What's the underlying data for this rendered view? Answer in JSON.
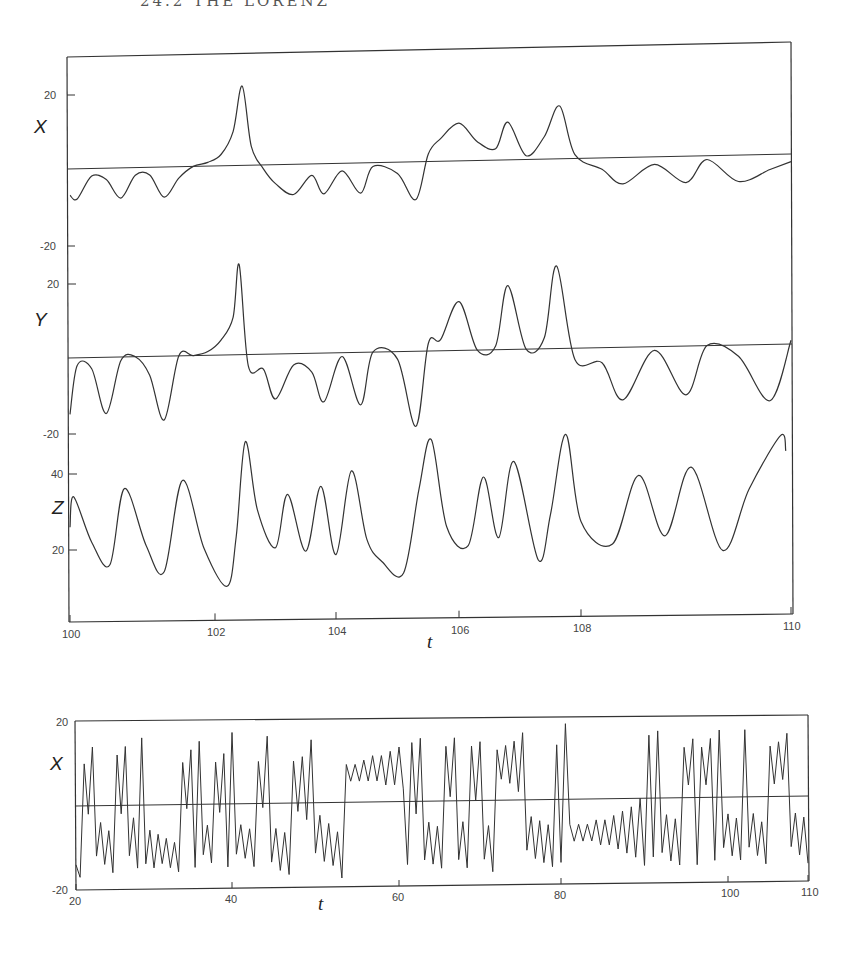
{
  "header": {
    "text": "24.2   THE LORENZ"
  },
  "chart_data": [
    {
      "type": "line",
      "title": "",
      "xlabel": "t",
      "x_ticks": [
        100,
        102,
        104,
        106,
        108,
        110
      ],
      "xlim": [
        100,
        110
      ],
      "panels": [
        {
          "ylabel": "X",
          "y_ticks": [
            20,
            -20
          ],
          "zero_line": true,
          "series": {
            "name": "X",
            "x": [
              100.0,
              100.1,
              100.3,
              100.5,
              100.7,
              100.9,
              101.1,
              101.3,
              101.5,
              101.7,
              101.9,
              102.1,
              102.3,
              102.45,
              102.6,
              102.8,
              103.0,
              103.3,
              103.6,
              103.8,
              104.1,
              104.4,
              104.6,
              105.0,
              105.3,
              105.5,
              105.7,
              106.0,
              106.3,
              106.6,
              106.8,
              107.1,
              107.4,
              107.65,
              107.9,
              108.2,
              108.4,
              108.7,
              109.0,
              109.2,
              109.5,
              109.8,
              110.0
            ],
            "y": [
              -7,
              -8,
              -2,
              -3,
              -8,
              -2,
              -2,
              -8,
              -3,
              0,
              1,
              3,
              9,
              21,
              5,
              -1,
              -5,
              -8,
              -3,
              -8,
              -2,
              -8,
              -1,
              -3,
              -10,
              2,
              6,
              10,
              5,
              3,
              10,
              1,
              6,
              14,
              1,
              -3,
              -7,
              -2,
              -7,
              -1,
              -7,
              -4,
              -2
            ]
          }
        },
        {
          "ylabel": "Y",
          "y_ticks": [
            20,
            -20
          ],
          "zero_line": true,
          "series": {
            "name": "Y",
            "x": [
              100.0,
              100.1,
              100.3,
              100.5,
              100.7,
              100.9,
              101.1,
              101.3,
              101.5,
              101.7,
              101.9,
              102.1,
              102.3,
              102.4,
              102.55,
              102.8,
              103.0,
              103.3,
              103.6,
              103.8,
              104.1,
              104.4,
              104.6,
              105.0,
              105.3,
              105.5,
              105.7,
              106.0,
              106.3,
              106.6,
              106.8,
              107.1,
              107.4,
              107.6,
              107.9,
              108.2,
              108.4,
              108.7,
              109.0,
              109.2,
              109.5,
              109.8,
              110.0
            ],
            "y": [
              -15,
              -2,
              -3,
              -15,
              -1,
              0,
              -5,
              -17,
              0,
              0,
              1,
              4,
              10,
              24,
              -3,
              -4,
              -12,
              -3,
              -5,
              -13,
              -1,
              -14,
              0,
              -2,
              -20,
              2,
              3,
              13,
              0,
              1,
              17,
              0,
              3,
              22,
              -3,
              -4,
              -14,
              -1,
              -13,
              0,
              -3,
              -15,
              1
            ]
          }
        },
        {
          "ylabel": "Z",
          "y_ticks": [
            40,
            20
          ],
          "zero_line": false,
          "series": {
            "name": "Z",
            "x": [
              100.0,
              100.05,
              100.3,
              100.55,
              100.75,
              101.05,
              101.3,
              101.55,
              101.85,
              102.2,
              102.35,
              102.5,
              102.7,
              103.0,
              103.2,
              103.5,
              103.75,
              104.0,
              104.25,
              104.5,
              104.75,
              105.1,
              105.35,
              105.55,
              105.8,
              106.15,
              106.4,
              106.65,
              106.9,
              107.3,
              107.5,
              107.75,
              108.0,
              108.3,
              108.55,
              108.8,
              109.05,
              109.35,
              109.6,
              109.9,
              109.95
            ],
            "y": [
              26,
              34,
              22,
              16,
              36,
              21,
              14,
              38,
              20,
              10,
              23,
              48,
              30,
              20,
              34,
              19,
              36,
              18,
              40,
              22,
              16,
              13,
              35,
              48,
              25,
              20,
              38,
              22,
              42,
              16,
              28,
              49,
              26,
              20,
              38,
              22,
              40,
              18,
              34,
              48,
              44
            ]
          }
        }
      ]
    },
    {
      "type": "line",
      "title": "",
      "xlabel": "t",
      "ylabel": "X",
      "x_ticks": [
        20,
        40,
        60,
        80,
        100,
        110
      ],
      "xlim": [
        20,
        110
      ],
      "y_ticks": [
        20,
        -20
      ],
      "ylim": [
        -20,
        20
      ],
      "zero_line": true,
      "series": {
        "name": "X (long run)",
        "description": "Chaotic oscillation: groups of positive peaks (~+8 to +18) alternating with groups of negative oscillations (~-8 to -17); near-regular small-amplitude growing oscillations around +8 at t≈56-62 and around -9 at t≈81-88."
      }
    }
  ]
}
